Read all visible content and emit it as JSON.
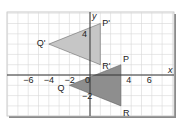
{
  "chart_data": {
    "type": "scatter",
    "title": "",
    "xlabel": "x",
    "ylabel": "y",
    "xlim": [
      -8,
      8
    ],
    "ylim": [
      -4,
      6
    ],
    "grid": true,
    "x_ticks": [
      {
        "value": -6,
        "label": "−6"
      },
      {
        "value": -4,
        "label": "−4"
      },
      {
        "value": -2,
        "label": "−2"
      },
      {
        "value": 0,
        "label": "0"
      },
      {
        "value": 4,
        "label": "4"
      },
      {
        "value": 6,
        "label": "6"
      }
    ],
    "y_ticks": [
      {
        "value": 4,
        "label": "4"
      },
      {
        "value": -2,
        "label": "−2"
      }
    ],
    "shapes": [
      {
        "name": "Triangle PQR",
        "fill": "#8e8e8e",
        "vertices": [
          {
            "label": "P",
            "x": 3,
            "y": 1
          },
          {
            "label": "Q",
            "x": -2,
            "y": -1
          },
          {
            "label": "R",
            "x": 3,
            "y": -3
          }
        ]
      },
      {
        "name": "Triangle P'Q'R'",
        "fill": "#c6c6c6",
        "vertices": [
          {
            "label": "P'",
            "x": 1,
            "y": 5
          },
          {
            "label": "Q'",
            "x": -4,
            "y": 3
          },
          {
            "label": "R'",
            "x": 1,
            "y": 1
          }
        ]
      }
    ]
  },
  "colors": {
    "grid": "#d6d6d6",
    "axis": "#333333",
    "frame": "#bdbdbd",
    "frame_shadow": "#8a8a8a"
  }
}
